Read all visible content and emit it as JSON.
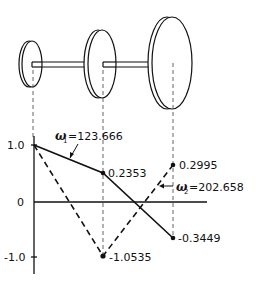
{
  "diagram": {
    "shaft": {
      "disks": [
        {
          "name": "disk-1",
          "size": "small"
        },
        {
          "name": "disk-2",
          "size": "medium"
        },
        {
          "name": "disk-3",
          "size": "large"
        }
      ]
    },
    "axis": {
      "y_ticks": [
        "1.0",
        "0",
        "-1.0"
      ]
    },
    "mode1": {
      "label_omega": "ω",
      "label_sub": "1",
      "label_value": "=123.666",
      "values": [
        1.0,
        0.2353,
        -0.3449
      ],
      "value_labels": [
        "0.2353",
        "-0.3449"
      ],
      "line_style": "solid"
    },
    "mode2": {
      "label_omega": "ω",
      "label_sub": "2",
      "label_value": "=202.658",
      "values": [
        1.0,
        -1.0535,
        0.2995
      ],
      "value_labels": [
        "-1.0535",
        "0.2995"
      ],
      "line_style": "dashed"
    },
    "colors": {
      "ink": "#111111",
      "guide": "#555555",
      "background": "#ffffff"
    }
  }
}
